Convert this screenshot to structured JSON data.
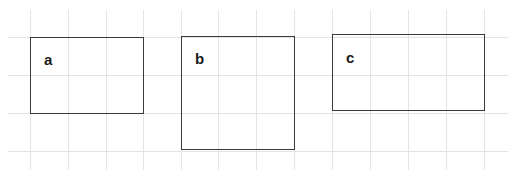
{
  "grid": {
    "color": "#e4e4e4",
    "vertical_x": [
      30,
      68,
      106,
      143,
      181,
      218,
      256,
      294,
      332,
      370,
      408,
      446,
      484
    ],
    "horizontal_y": [
      37,
      75,
      113,
      151
    ]
  },
  "shapes": [
    {
      "id": "a",
      "label": "a",
      "x": 30,
      "y": 37,
      "w": 113,
      "h": 77,
      "grid_w": 3,
      "grid_h": 2
    },
    {
      "id": "b",
      "label": "b",
      "x": 181,
      "y": 37,
      "w": 114,
      "h": 114,
      "grid_w": 3,
      "grid_h": 3
    },
    {
      "id": "c",
      "label": "c",
      "x": 332,
      "y": 35,
      "w": 153,
      "h": 77,
      "grid_w": 4,
      "grid_h": 2
    }
  ],
  "colors": {
    "stroke": "#3a3a3a",
    "text": "#1a1a1a",
    "background": "#ffffff"
  }
}
